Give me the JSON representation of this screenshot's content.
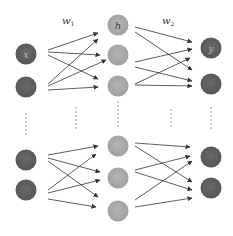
{
  "diagram": {
    "type": "neural-network",
    "weights": {
      "w1": {
        "label": "w",
        "subscript": "1"
      },
      "w2": {
        "label": "w",
        "subscript": "2"
      }
    },
    "layers": {
      "input": {
        "label": "x",
        "color": "#5f5f5f",
        "node_count_visible": 4
      },
      "hidden": {
        "label": "h",
        "color": "#a9a9a9",
        "node_count_visible": 6
      },
      "output": {
        "label": "y",
        "color": "#5f5f5f",
        "node_count_visible": 4
      }
    },
    "colors": {
      "dark_node": "#5f5f5f",
      "light_node": "#a9a9a9",
      "arrow": "#333333",
      "ellipsis_dots": "#888888",
      "background": "#ffffff"
    }
  }
}
